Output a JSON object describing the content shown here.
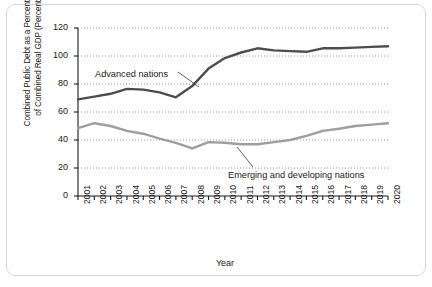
{
  "chart_data": {
    "type": "line",
    "title": "",
    "xlabel": "Year",
    "ylabel": "Combined Public Debt as a Percentage\nof Combined Real GDP (Percent)",
    "ylim": [
      0,
      120
    ],
    "yticks": [
      0,
      20,
      40,
      60,
      80,
      100,
      120
    ],
    "ytick_labels": [
      "0",
      "20",
      "40",
      "60",
      "80",
      "100",
      "120"
    ],
    "grid": "horizontal-dotted",
    "legend_position": "inline-annotations",
    "x": [
      2001,
      2002,
      2003,
      2004,
      2005,
      2006,
      2007,
      2008,
      2009,
      2010,
      2011,
      2012,
      2013,
      2014,
      2015,
      2016,
      2017,
      2018,
      2019,
      2020
    ],
    "xtick_labels": [
      "2001",
      "2002",
      "2003",
      "2004",
      "2005",
      "2006",
      "2007",
      "2008",
      "2009",
      "2010",
      "2011",
      "2012",
      "2013",
      "2014",
      "2015",
      "2016",
      "2017",
      "2018",
      "2019",
      "2020"
    ],
    "series": [
      {
        "name": "Advanced nations",
        "color": "#4d4d4d",
        "values": [
          69,
          71,
          73,
          76.5,
          76,
          74,
          70.5,
          78.5,
          91,
          98.5,
          102.5,
          105.5,
          104,
          103.5,
          103,
          105.5,
          105.5,
          106,
          106.5,
          107
        ]
      },
      {
        "name": "Emerging and developing nations",
        "color": "#9e9e9e",
        "values": [
          48.5,
          52,
          50,
          46.5,
          44.5,
          41,
          38,
          34,
          38.5,
          38,
          37,
          37,
          38.5,
          40,
          43,
          46.5,
          48,
          50,
          51,
          52
        ]
      }
    ],
    "annotations": [
      {
        "label": "Advanced nations",
        "target_year": 2008,
        "target_value": 81
      },
      {
        "label": "Emerging and developing nations",
        "target_year": 2013,
        "target_value": 39.5
      }
    ]
  }
}
